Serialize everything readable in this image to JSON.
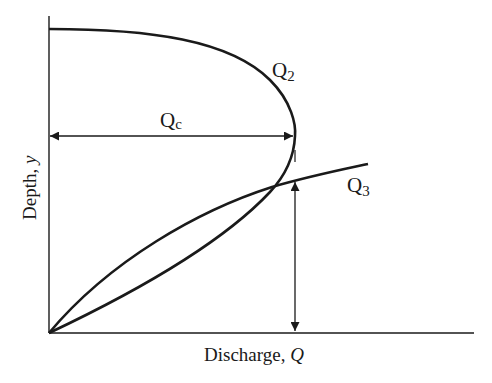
{
  "diagram": {
    "type": "depth-discharge curves",
    "axes": {
      "x_label": "Discharge, ",
      "x_label_var": "Q",
      "y_label": "Depth, ",
      "y_label_var": "y"
    },
    "curves": [
      {
        "name": "Q2",
        "label_main": "Q",
        "label_sub": "2"
      },
      {
        "name": "Q3",
        "label_main": "Q",
        "label_sub": "3"
      }
    ],
    "annotations": {
      "critical_discharge_main": "Q",
      "critical_discharge_sub": "c"
    },
    "colors": {
      "stroke": "#1a1a1a",
      "background": "#ffffff"
    }
  }
}
